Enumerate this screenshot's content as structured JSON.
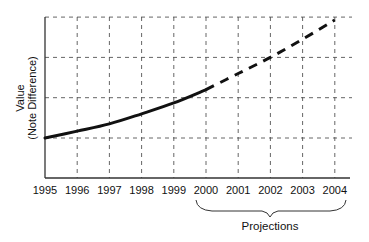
{
  "chart_data": {
    "type": "line",
    "title": "",
    "xlabel": "",
    "ylabel": "Value",
    "ylabel_sub": "(Note Difference)",
    "x": [
      1995,
      1996,
      1997,
      1998,
      1999,
      2000,
      2001,
      2002,
      2003,
      2004
    ],
    "series": [
      {
        "name": "Actual",
        "style": "solid",
        "x": [
          1995,
          1996,
          1997,
          1998,
          1999,
          2000
        ],
        "values": [
          1.0,
          1.17,
          1.35,
          1.6,
          1.87,
          2.2
        ]
      },
      {
        "name": "Projected",
        "style": "dashed",
        "x": [
          2000,
          2001,
          2002,
          2003,
          2004
        ],
        "values": [
          2.2,
          2.6,
          3.0,
          3.45,
          3.93
        ]
      }
    ],
    "ylim": [
      0,
      4
    ],
    "y_gridlines": [
      1,
      2,
      3,
      4
    ],
    "yticks_labeled": false,
    "grid": true,
    "grid_style": "dashed",
    "annotations": [
      {
        "text": "Projections",
        "type": "brace",
        "span": [
          2000,
          2004
        ]
      }
    ],
    "legend": null
  },
  "axes": {
    "ylabel_line1": "Value",
    "ylabel_line2": "(Note Difference)",
    "xticks": [
      "1995",
      "1996",
      "1997",
      "1998",
      "1999",
      "2000",
      "2001",
      "2002",
      "2003",
      "2004"
    ]
  },
  "annotation": {
    "projections_label": "Projections"
  },
  "colors": {
    "line": "#111111",
    "grid": "#555555",
    "axis": "#333333"
  }
}
